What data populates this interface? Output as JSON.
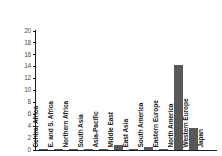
{
  "chart_data": {
    "type": "bar",
    "title": "",
    "subtitle": "",
    "xlabel": "",
    "ylabel": "",
    "ylim": [
      0,
      20
    ],
    "ytick_values": [
      20,
      18,
      16,
      14,
      12,
      10,
      8,
      6,
      4,
      2,
      0
    ],
    "ytick_labels": [
      "20",
      "18",
      "16",
      "14",
      "12",
      "10",
      "8",
      "6",
      "4",
      "2",
      "0"
    ],
    "grid": false,
    "legend": false,
    "bar_color": "#595959",
    "axis_color": "#1a1a1a",
    "tick_label_color": "#4d4d4d",
    "categories": [
      "Central Africa",
      "E. and S. Africa",
      "Northern Africa",
      "South Asia",
      "Asia-Pacific",
      "Middle East",
      "East Asia",
      "South America",
      "Eastern Europe",
      "North America",
      "Western Europe",
      "Japan"
    ],
    "values": [
      0.05,
      0.1,
      0.05,
      0.05,
      0.05,
      0.8,
      0.05,
      0.45,
      0.05,
      14.3,
      3.7,
      0.0
    ]
  }
}
